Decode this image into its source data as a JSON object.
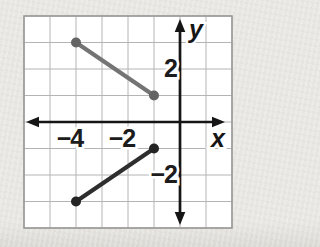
{
  "figure": {
    "axis_labels": {
      "x": "x",
      "y": "y"
    },
    "tick_labels": {
      "x": [
        {
          "value": -4,
          "label": "−4"
        },
        {
          "value": -2,
          "label": "−2"
        }
      ],
      "y": [
        {
          "value": 2,
          "label": "2"
        },
        {
          "value": -2,
          "label": "−2"
        }
      ]
    }
  },
  "chart_data": {
    "type": "line",
    "title": "",
    "xlabel": "x",
    "ylabel": "y",
    "x_range": [
      -6,
      2
    ],
    "y_range": [
      -4,
      4
    ],
    "grid": true,
    "grid_step": 1,
    "legend": "none",
    "series": [
      {
        "name": "upper-gray-segment",
        "color": "#747474",
        "dot_color": "#646464",
        "points": [
          [
            -4,
            3
          ],
          [
            -1,
            1
          ]
        ]
      },
      {
        "name": "lower-dark-segment",
        "color": "#2e2e2e",
        "dot_color": "#242424",
        "points": [
          [
            -4,
            -3
          ],
          [
            -1,
            -1
          ]
        ]
      }
    ]
  },
  "colors": {
    "page_bg": "#e8e7e3",
    "plot_bg": "#ffffff",
    "grid": "#b4b4b4",
    "border": "#9a9a9a",
    "axis": "#151515",
    "label": "#1c1c1c"
  }
}
